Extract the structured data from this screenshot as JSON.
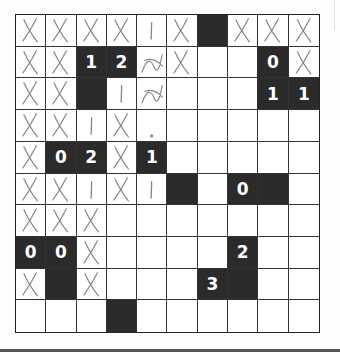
{
  "puzzle": {
    "name": "Light Up",
    "rows": 10,
    "cols": 10,
    "colors": {
      "black_cell": "#2b2b2b",
      "clue_text": "#ffffff",
      "grid_line": "#333333",
      "pencil": "#888888"
    },
    "black_cells": [
      {
        "r": 0,
        "c": 6,
        "clue": ""
      },
      {
        "r": 1,
        "c": 2,
        "clue": "1"
      },
      {
        "r": 1,
        "c": 3,
        "clue": "2"
      },
      {
        "r": 1,
        "c": 8,
        "clue": "0"
      },
      {
        "r": 2,
        "c": 2,
        "clue": ""
      },
      {
        "r": 2,
        "c": 8,
        "clue": "1"
      },
      {
        "r": 2,
        "c": 9,
        "clue": "1"
      },
      {
        "r": 4,
        "c": 1,
        "clue": "0"
      },
      {
        "r": 4,
        "c": 2,
        "clue": "2"
      },
      {
        "r": 4,
        "c": 4,
        "clue": "1"
      },
      {
        "r": 5,
        "c": 5,
        "clue": ""
      },
      {
        "r": 5,
        "c": 7,
        "clue": "0"
      },
      {
        "r": 5,
        "c": 8,
        "clue": ""
      },
      {
        "r": 7,
        "c": 0,
        "clue": "0"
      },
      {
        "r": 7,
        "c": 1,
        "clue": "0"
      },
      {
        "r": 7,
        "c": 7,
        "clue": "2"
      },
      {
        "r": 8,
        "c": 1,
        "clue": ""
      },
      {
        "r": 8,
        "c": 6,
        "clue": "3"
      },
      {
        "r": 8,
        "c": 7,
        "clue": ""
      },
      {
        "r": 9,
        "c": 3,
        "clue": ""
      }
    ],
    "pencil_marks": [
      {
        "r": 0,
        "c": 0,
        "type": "x"
      },
      {
        "r": 0,
        "c": 1,
        "type": "x"
      },
      {
        "r": 0,
        "c": 2,
        "type": "x"
      },
      {
        "r": 0,
        "c": 3,
        "type": "x"
      },
      {
        "r": 0,
        "c": 4,
        "type": "line"
      },
      {
        "r": 0,
        "c": 5,
        "type": "x"
      },
      {
        "r": 0,
        "c": 7,
        "type": "x"
      },
      {
        "r": 0,
        "c": 8,
        "type": "x"
      },
      {
        "r": 0,
        "c": 9,
        "type": "x"
      },
      {
        "r": 1,
        "c": 0,
        "type": "x"
      },
      {
        "r": 1,
        "c": 1,
        "type": "x"
      },
      {
        "r": 1,
        "c": 4,
        "type": "scribble"
      },
      {
        "r": 1,
        "c": 5,
        "type": "x"
      },
      {
        "r": 1,
        "c": 9,
        "type": "x"
      },
      {
        "r": 2,
        "c": 0,
        "type": "x"
      },
      {
        "r": 2,
        "c": 1,
        "type": "x"
      },
      {
        "r": 2,
        "c": 3,
        "type": "line"
      },
      {
        "r": 2,
        "c": 4,
        "type": "scribble"
      },
      {
        "r": 3,
        "c": 0,
        "type": "x"
      },
      {
        "r": 3,
        "c": 1,
        "type": "x"
      },
      {
        "r": 3,
        "c": 2,
        "type": "line"
      },
      {
        "r": 3,
        "c": 3,
        "type": "x"
      },
      {
        "r": 4,
        "c": 0,
        "type": "x"
      },
      {
        "r": 4,
        "c": 3,
        "type": "x"
      },
      {
        "r": 3,
        "c": 4,
        "type": "dot"
      },
      {
        "r": 5,
        "c": 0,
        "type": "x"
      },
      {
        "r": 5,
        "c": 1,
        "type": "x"
      },
      {
        "r": 5,
        "c": 2,
        "type": "line"
      },
      {
        "r": 5,
        "c": 3,
        "type": "x"
      },
      {
        "r": 5,
        "c": 4,
        "type": "line"
      },
      {
        "r": 6,
        "c": 0,
        "type": "x"
      },
      {
        "r": 6,
        "c": 1,
        "type": "x"
      },
      {
        "r": 6,
        "c": 2,
        "type": "x"
      },
      {
        "r": 7,
        "c": 2,
        "type": "x"
      },
      {
        "r": 8,
        "c": 0,
        "type": "x"
      },
      {
        "r": 8,
        "c": 2,
        "type": "x"
      }
    ]
  }
}
